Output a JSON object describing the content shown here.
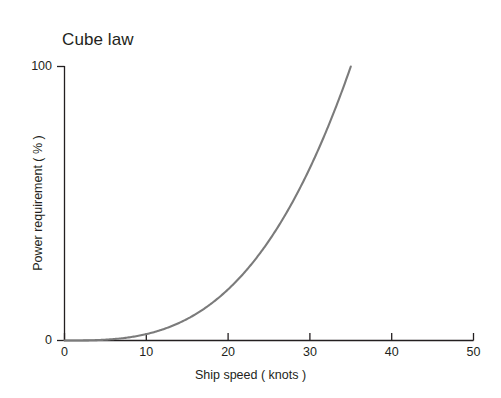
{
  "chart_data": {
    "type": "line",
    "title": "Cube law",
    "xlabel": "Ship speed ( knots )",
    "ylabel": "Power requirement ( % )",
    "xlim": [
      0,
      50
    ],
    "ylim": [
      0,
      100
    ],
    "xticks": [
      0,
      10,
      20,
      30,
      40,
      50
    ],
    "xtick_labels": [
      "0",
      "10",
      "20",
      "30",
      "40",
      "50"
    ],
    "yticks": [
      0,
      100
    ],
    "ytick_labels": [
      "0",
      "100"
    ],
    "grid": false,
    "legend": null,
    "series": [
      {
        "name": "Cube law power curve",
        "color": "#7b7b7b",
        "relation": "power = 100 * (speed / 35)^3",
        "x": [
          0,
          2,
          4,
          6,
          8,
          10,
          12,
          14,
          16,
          18,
          20,
          22,
          24,
          26,
          28,
          30,
          32,
          34,
          35
        ],
        "values": [
          0,
          0.2,
          1.5,
          5.0,
          11.9,
          23.3,
          40.3,
          64.0,
          95.5,
          136.0,
          18.7,
          24.9,
          32.3,
          41.0,
          51.2,
          63.0,
          76.5,
          91.7,
          100
        ]
      }
    ],
    "curve_points": [
      {
        "x": 0,
        "y": 0
      },
      {
        "x": 5,
        "y": 0.3
      },
      {
        "x": 10,
        "y": 2.3
      },
      {
        "x": 15,
        "y": 7.9
      },
      {
        "x": 20,
        "y": 18.7
      },
      {
        "x": 25,
        "y": 36.4
      },
      {
        "x": 30,
        "y": 63.0
      },
      {
        "x": 35,
        "y": 100
      }
    ],
    "annotations": []
  },
  "axes": {
    "axis_color": "#231f20",
    "curve_color": "#7b7b7b",
    "background": "#ffffff"
  }
}
